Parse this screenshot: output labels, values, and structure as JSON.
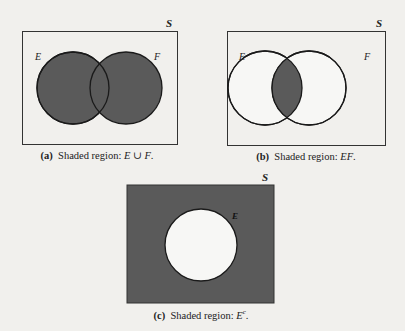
{
  "colors": {
    "background": "#f1f0ed",
    "shade": "#5a5a5a",
    "stroke": "#1a1a1a",
    "unshaded": "#f7f7f5"
  },
  "panels": [
    {
      "id": "a",
      "universe_label": "S",
      "set_labels": [
        "E",
        "F"
      ],
      "shaded_region": "E ∪ F",
      "caption_tag": "(a)",
      "caption_text": "Shaded region: ",
      "caption_math": "E ∪ F",
      "caption_end": "."
    },
    {
      "id": "b",
      "universe_label": "S",
      "set_labels": [
        "E",
        "F"
      ],
      "shaded_region": "EF",
      "caption_tag": "(b)",
      "caption_text": "Shaded region: ",
      "caption_math": "EF",
      "caption_end": "."
    },
    {
      "id": "c",
      "universe_label": "S",
      "set_labels": [
        "E"
      ],
      "shaded_region": "E^c",
      "caption_tag": "(c)",
      "caption_text": "Shaded region: ",
      "caption_math": "E",
      "caption_sup": "c",
      "caption_end": "."
    }
  ]
}
